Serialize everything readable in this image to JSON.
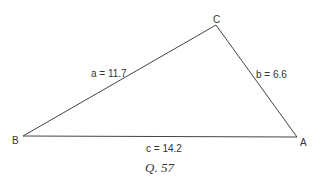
{
  "diagram": {
    "type": "triangle",
    "vertices": [
      {
        "name": "A",
        "label": "A"
      },
      {
        "name": "B",
        "label": "B"
      },
      {
        "name": "C",
        "label": "C"
      }
    ],
    "sides": [
      {
        "name": "a",
        "label": "a = 11.7",
        "value": 11.7,
        "between": "B-C"
      },
      {
        "name": "b",
        "label": "b = 6.6",
        "value": 6.6,
        "between": "C-A"
      },
      {
        "name": "c",
        "label": "c = 14.2",
        "value": 14.2,
        "between": "B-A"
      }
    ],
    "caption": "Q. 57"
  }
}
